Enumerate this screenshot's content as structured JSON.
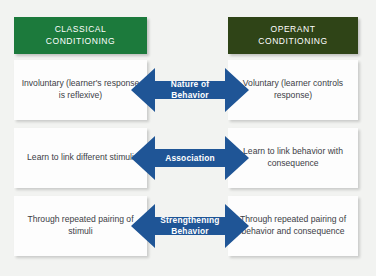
{
  "diagram": {
    "background_color": "#f2f3f1",
    "headers": {
      "left": {
        "label": "CLASSICAL\nCONDITIONING",
        "line1": "CLASSICAL",
        "line2": "CONDITIONING",
        "color": "#1c7a3c"
      },
      "right": {
        "label": "OPERANT\nCONDITIONING",
        "line1": "OPERANT",
        "line2": "CONDITIONING",
        "color": "#2f4417"
      }
    },
    "arrow_color": "#1f5596",
    "text_color": "#3c4046",
    "rows": [
      {
        "center_label": "Nature of Behavior",
        "center_line1": "Nature of",
        "center_line2": "Behavior",
        "left_text": "Involuntary (learner's response is reflexive)",
        "right_text": "Voluntary (learner controls response)"
      },
      {
        "center_label": "Association",
        "center_line1": "Association",
        "center_line2": "",
        "left_text": "Learn to link different stimuli",
        "right_text": "Learn to link behavior with consequence"
      },
      {
        "center_label": "Strengthening Behavior",
        "center_line1": "Strengthening",
        "center_line2": "Behavior",
        "left_text": "Through repeated pairing of stimuli",
        "right_text": "Through repeated pairing of behavior and consequence"
      }
    ]
  }
}
